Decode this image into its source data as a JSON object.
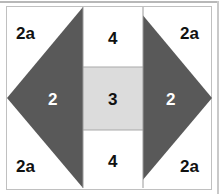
{
  "diagram": {
    "canvas": {
      "width": 219,
      "height": 194
    },
    "colors": {
      "background": "#ffffff",
      "triangle_fill": "#595959",
      "center_square_fill": "#dcdcdc",
      "sash_fill": "#ffffff",
      "frame_border": "#c0c0c0",
      "top_rule": "#b8b8b8",
      "label_dark": "#111111",
      "label_light": "#ffffff"
    },
    "pieces": [
      {
        "id": "corner-top-left",
        "label": "2a",
        "fill": "#ffffff",
        "text_color": "#111111"
      },
      {
        "id": "corner-top-right",
        "label": "2a",
        "fill": "#ffffff",
        "text_color": "#111111"
      },
      {
        "id": "corner-bottom-left",
        "label": "2a",
        "fill": "#ffffff",
        "text_color": "#111111"
      },
      {
        "id": "corner-bottom-right",
        "label": "2a",
        "fill": "#ffffff",
        "text_color": "#111111"
      },
      {
        "id": "triangle-left",
        "label": "2",
        "fill": "#595959",
        "text_color": "#ffffff"
      },
      {
        "id": "triangle-right",
        "label": "2",
        "fill": "#595959",
        "text_color": "#ffffff"
      },
      {
        "id": "sash-top",
        "label": "4",
        "fill": "#ffffff",
        "text_color": "#111111"
      },
      {
        "id": "sash-bottom",
        "label": "4",
        "fill": "#ffffff",
        "text_color": "#111111"
      },
      {
        "id": "center-square",
        "label": "3",
        "fill": "#dcdcdc",
        "text_color": "#111111"
      }
    ],
    "labels": {
      "corner_top_left": "2a",
      "corner_top_right": "2a",
      "corner_bottom_left": "2a",
      "corner_bottom_right": "2a",
      "triangle_left": "2",
      "triangle_right": "2",
      "sash_top": "4",
      "sash_bottom": "4",
      "center_square": "3"
    },
    "geometry": {
      "frame": {
        "x": 6,
        "y": 6,
        "width": 206,
        "height": 184
      },
      "triangle_left_points": "83,7 83,188 7,98",
      "triangle_right_points": "136,7 136,188 212,98",
      "center_column": {
        "x": 83,
        "y": 7,
        "width": 60,
        "height": 181
      },
      "center_square": {
        "x": 83,
        "y": 67,
        "width": 60,
        "height": 63
      }
    }
  }
}
